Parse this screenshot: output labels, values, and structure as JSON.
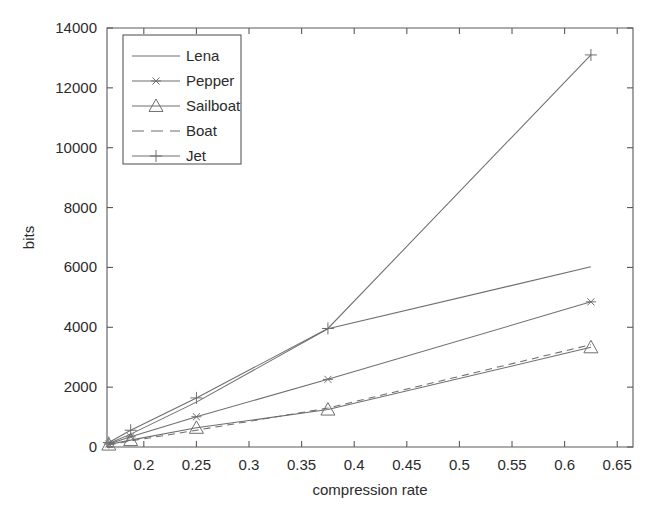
{
  "chart_data": {
    "type": "line",
    "title": "",
    "xlabel": "compression rate",
    "ylabel": "bits",
    "xlim": [
      0.165,
      0.665
    ],
    "ylim": [
      0,
      14000
    ],
    "xticks": [
      0.2,
      0.25,
      0.3,
      0.35,
      0.4,
      0.45,
      0.5,
      0.55,
      0.6,
      0.65
    ],
    "xtick_labels": [
      "0.2",
      "0.25",
      "0.3",
      "0.35",
      "0.4",
      "0.45",
      "0.5",
      "0.55",
      "0.6",
      "0.65"
    ],
    "yticks": [
      0,
      2000,
      4000,
      6000,
      8000,
      10000,
      12000,
      14000
    ],
    "ytick_labels": [
      "0",
      "2000",
      "4000",
      "6000",
      "8000",
      "10000",
      "12000",
      "14000"
    ],
    "grid": false,
    "legend_position": "upper-left",
    "x": [
      0.1667,
      0.1875,
      0.25,
      0.375,
      0.625
    ],
    "series": [
      {
        "name": "Lena",
        "marker": "none",
        "linestyle": "solid",
        "color": "#6e6e6e",
        "values": [
          120,
          430,
          1500,
          3950,
          6020
        ]
      },
      {
        "name": "Pepper",
        "marker": "asterisk",
        "linestyle": "solid",
        "color": "#6e6e6e",
        "values": [
          100,
          340,
          1010,
          2260,
          4850
        ]
      },
      {
        "name": "Sailboat",
        "marker": "triangle",
        "linestyle": "solid",
        "color": "#6e6e6e",
        "values": [
          80,
          230,
          640,
          1250,
          3330
        ]
      },
      {
        "name": "Boat",
        "marker": "none",
        "linestyle": "dashed",
        "color": "#6e6e6e",
        "values": [
          70,
          200,
          560,
          1300,
          3420
        ]
      },
      {
        "name": "Jet",
        "marker": "plus",
        "linestyle": "solid",
        "color": "#6e6e6e",
        "values": [
          150,
          560,
          1640,
          3960,
          13100
        ]
      }
    ]
  },
  "legend": {
    "entries": [
      {
        "label": "Lena"
      },
      {
        "label": "Pepper"
      },
      {
        "label": "Sailboat"
      },
      {
        "label": "Boat"
      },
      {
        "label": "Jet"
      }
    ]
  }
}
